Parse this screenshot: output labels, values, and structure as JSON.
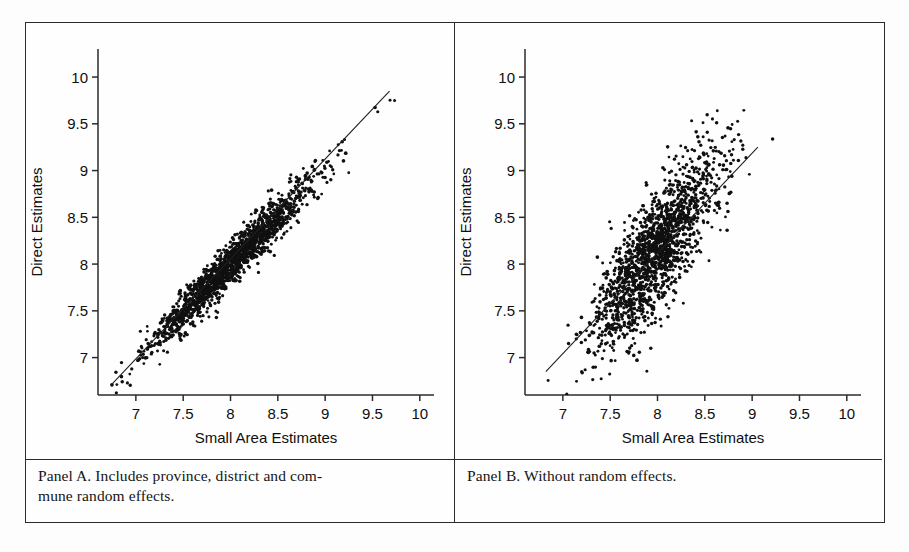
{
  "figure": {
    "panels": [
      {
        "id": "panel-a",
        "caption": "Panel A. Includes province, district and com-\nmune random effects.",
        "xlabel": "Small Area Estimates",
        "ylabel": "Direct Estimates"
      },
      {
        "id": "panel-b",
        "caption": "Panel B. Without random effects.",
        "xlabel": "Small Area Estimates",
        "ylabel": "Direct Estimates"
      }
    ],
    "colors": {
      "frame": "#2b2b2b",
      "point": "#101010",
      "line": "#202020",
      "background": "#fefefe"
    }
  },
  "chart_data": [
    {
      "type": "scatter",
      "panel": "Panel A",
      "title": "",
      "xlabel": "Small Area Estimates",
      "ylabel": "Direct Estimates",
      "xlim": [
        6.6,
        10.15
      ],
      "ylim": [
        6.6,
        10.3
      ],
      "xticks": [
        7,
        7.5,
        8,
        8.5,
        9,
        9.5,
        10
      ],
      "xtick_labels": [
        "7",
        "7.5",
        "8",
        "8.5",
        "9",
        "9.5",
        "10"
      ],
      "yticks": [
        7,
        7.5,
        8,
        8.5,
        9,
        9.5,
        10
      ],
      "ytick_labels": [
        "7",
        "7.5",
        "8",
        "8.5",
        "9",
        "9.5",
        "10"
      ],
      "grid": false,
      "legend": false,
      "n_points": 1700,
      "cloud": {
        "description": "tight positively-correlated diagonal band, very high correlation",
        "x_mean": 8.0,
        "x_sd": 0.42,
        "correlation": 0.95,
        "residual_sd": 0.115,
        "slope": 1.02,
        "intercept": -0.16
      },
      "fit_line": {
        "x_start": 6.75,
        "y_start": 6.72,
        "x_end": 9.68,
        "y_end": 9.85
      }
    },
    {
      "type": "scatter",
      "panel": "Panel B",
      "title": "",
      "xlabel": "Small Area Estimates",
      "ylabel": "Direct Estimates",
      "xlim": [
        6.6,
        10.15
      ],
      "ylim": [
        6.6,
        10.3
      ],
      "xticks": [
        7,
        7.5,
        8,
        8.5,
        9,
        9.5,
        10
      ],
      "xtick_labels": [
        "7",
        "7.5",
        "8",
        "8.5",
        "9",
        "9.5",
        "10"
      ],
      "yticks": [
        7,
        7.5,
        8,
        8.5,
        9,
        9.5,
        10
      ],
      "ytick_labels": [
        "7",
        "7.5",
        "8",
        "8.5",
        "9",
        "9.5",
        "10"
      ],
      "grid": false,
      "legend": false,
      "n_points": 1700,
      "cloud": {
        "description": "broad, vertically dispersed cloud concentrated near x=7.8, weaker correlation",
        "x_mean": 7.95,
        "x_sd": 0.33,
        "correlation": 0.72,
        "residual_sd": 0.3,
        "slope": 1.3,
        "intercept": -2.25
      },
      "fit_line": {
        "x_start": 6.82,
        "y_start": 6.85,
        "x_end": 9.06,
        "y_end": 9.25
      }
    }
  ]
}
